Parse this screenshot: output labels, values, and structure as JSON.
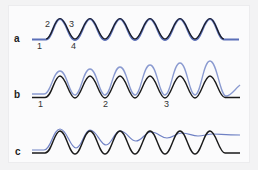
{
  "figure": {
    "colors": {
      "trace_black": "#1a1a1a",
      "trace_blue": "#5b6fb8",
      "trace_blue_light": "#8a9ad0",
      "background": "#f3f3f4",
      "panel": "#fbfbfc"
    },
    "panels": [
      {
        "id": "a",
        "label": "a",
        "annotations": [
          {
            "text": "1",
            "x": 37,
            "y": 48
          },
          {
            "text": "2",
            "x": 45,
            "y": 26
          },
          {
            "text": "3",
            "x": 69,
            "y": 26
          },
          {
            "text": "4",
            "x": 71,
            "y": 48
          }
        ],
        "description": "Black and blue traces superimposed; six identical oscillations; blue visible at troughs and flat ends"
      },
      {
        "id": "b",
        "label": "b",
        "annotations": [
          {
            "text": "1",
            "x": 38,
            "y": 106
          },
          {
            "text": "2",
            "x": 103,
            "y": 106
          },
          {
            "text": "3",
            "x": 164,
            "y": 106
          }
        ],
        "description": "Blue trace shifted upward with increasing peak amplitude across six oscillations; blue rises at the end"
      },
      {
        "id": "c",
        "label": "c",
        "annotations": [],
        "description": "Blue trace follows black initially then damps to a nearly flat line while black continues oscillating"
      }
    ]
  }
}
